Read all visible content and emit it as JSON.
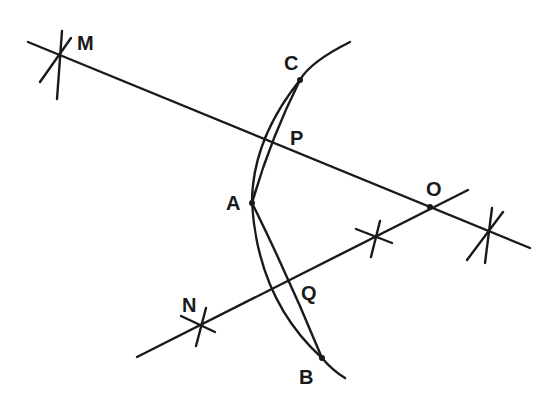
{
  "diagram": {
    "title": "",
    "colors": {
      "ink": "#1a1a1a",
      "background": "#ffffff"
    },
    "points": [
      {
        "id": "M",
        "label": "M",
        "x": 57,
        "y": 55,
        "label_x": 77,
        "label_y": 50
      },
      {
        "id": "C",
        "label": "C",
        "x": 300,
        "y": 80,
        "label_x": 284,
        "label_y": 70
      },
      {
        "id": "P",
        "label": "P",
        "x": 283,
        "y": 145,
        "label_x": 290,
        "label_y": 145
      },
      {
        "id": "A",
        "label": "A",
        "x": 252,
        "y": 203,
        "label_x": 226,
        "label_y": 210
      },
      {
        "id": "O",
        "label": "O",
        "x": 430,
        "y": 207,
        "label_x": 426,
        "label_y": 196
      },
      {
        "id": "N",
        "label": "N",
        "x": 200,
        "y": 326,
        "label_x": 182,
        "label_y": 312
      },
      {
        "id": "Q",
        "label": "Q",
        "x": 288,
        "y": 287,
        "label_x": 301,
        "label_y": 300
      },
      {
        "id": "B",
        "label": "B",
        "x": 322,
        "y": 358,
        "label_x": 299,
        "label_y": 384
      }
    ],
    "lines": [
      {
        "id": "line-MO",
        "through": [
          "M",
          "P",
          "O"
        ]
      },
      {
        "id": "line-NO",
        "through": [
          "N",
          "Q",
          "O"
        ]
      },
      {
        "id": "chord-AC",
        "through": [
          "A",
          "C"
        ]
      },
      {
        "id": "chord-AB",
        "through": [
          "A",
          "B"
        ]
      }
    ],
    "arcs": [
      {
        "id": "arc-CAB",
        "through": [
          "C",
          "A",
          "B"
        ]
      }
    ],
    "construction_marks": [
      {
        "id": "mark-M",
        "at": "M"
      },
      {
        "id": "mark-N",
        "at": "N"
      },
      {
        "id": "mark-NO-mid",
        "x": 375,
        "y": 235
      },
      {
        "id": "mark-MO-right",
        "x": 490,
        "y": 232
      }
    ]
  }
}
